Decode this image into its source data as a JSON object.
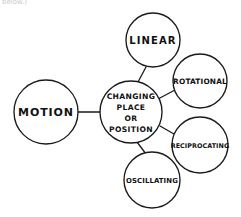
{
  "diagram": {
    "type": "mind-map",
    "title_fragment": "below.)",
    "background_color": "#ffffff",
    "ink_color": "#1a1a1a",
    "root": {
      "id": "motion",
      "label": "MOTION",
      "cx": 46,
      "cy": 112,
      "r": 32
    },
    "hub": {
      "id": "changing-place-or-position",
      "label": "CHANGING PLACE OR POSITION",
      "lines": [
        "CHANGING",
        "PLACE",
        "OR",
        "POSITION"
      ],
      "cx": 131,
      "cy": 112,
      "r": 31
    },
    "branches": [
      {
        "id": "linear",
        "label": "LINEAR",
        "cx": 153,
        "cy": 40,
        "r": 27,
        "connector": {
          "x1": 138,
          "y1": 82,
          "x2": 146,
          "y2": 67
        }
      },
      {
        "id": "rotational",
        "label": "ROTATIONAL",
        "cx": 200,
        "cy": 81,
        "r": 27,
        "connector": {
          "x1": 158,
          "y1": 99,
          "x2": 175,
          "y2": 90
        }
      },
      {
        "id": "reciprocating",
        "label": "RECIPROCATING",
        "cx": 200,
        "cy": 145,
        "r": 28,
        "connector": {
          "x1": 160,
          "y1": 126,
          "x2": 174,
          "y2": 134
        }
      },
      {
        "id": "oscillating",
        "label": "OSCILLATING",
        "cx": 152,
        "cy": 180,
        "r": 28,
        "connector": {
          "x1": 137,
          "y1": 142,
          "x2": 146,
          "y2": 154
        }
      }
    ],
    "root_connector": {
      "x1": 78,
      "y1": 112,
      "x2": 100,
      "y2": 112
    }
  }
}
